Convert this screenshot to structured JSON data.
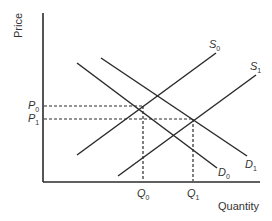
{
  "diagram": {
    "type": "supply-demand",
    "y_axis_label": "Price",
    "x_axis_label": "Quantity",
    "curves": [
      {
        "id": "S0",
        "symbol": "S",
        "subscript": "0",
        "kind": "supply"
      },
      {
        "id": "S1",
        "symbol": "S",
        "subscript": "1",
        "kind": "supply"
      },
      {
        "id": "D0",
        "symbol": "D",
        "subscript": "0",
        "kind": "demand"
      },
      {
        "id": "D1",
        "symbol": "D",
        "subscript": "1",
        "kind": "demand"
      }
    ],
    "price_levels": [
      {
        "symbol": "P",
        "subscript": "0"
      },
      {
        "symbol": "P",
        "subscript": "1"
      }
    ],
    "quantity_levels": [
      {
        "symbol": "Q",
        "subscript": "0"
      },
      {
        "symbol": "Q",
        "subscript": "1"
      }
    ],
    "equilibria": [
      {
        "supply": "S0",
        "demand": "D0",
        "price": "P0",
        "quantity": "Q0"
      },
      {
        "supply": "S1",
        "demand": "D1",
        "price": "P1",
        "quantity": "Q1"
      }
    ],
    "colors": {
      "line": "#2b2b2b",
      "text": "#333333",
      "background": "#ffffff"
    }
  }
}
